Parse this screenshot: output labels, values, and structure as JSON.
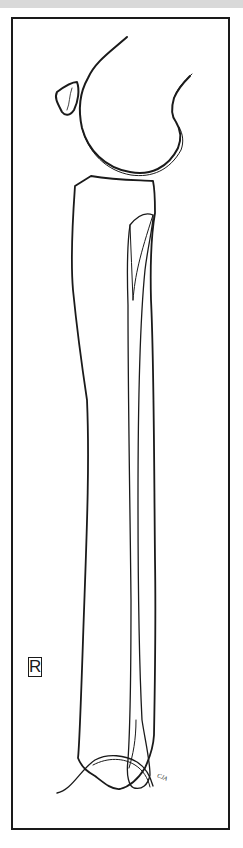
{
  "figure": {
    "side_marker": "R",
    "signature": "CJA",
    "colors": {
      "line": "#1a1a1a",
      "background": "#ffffff",
      "top_band": "#d9d9d9"
    }
  }
}
